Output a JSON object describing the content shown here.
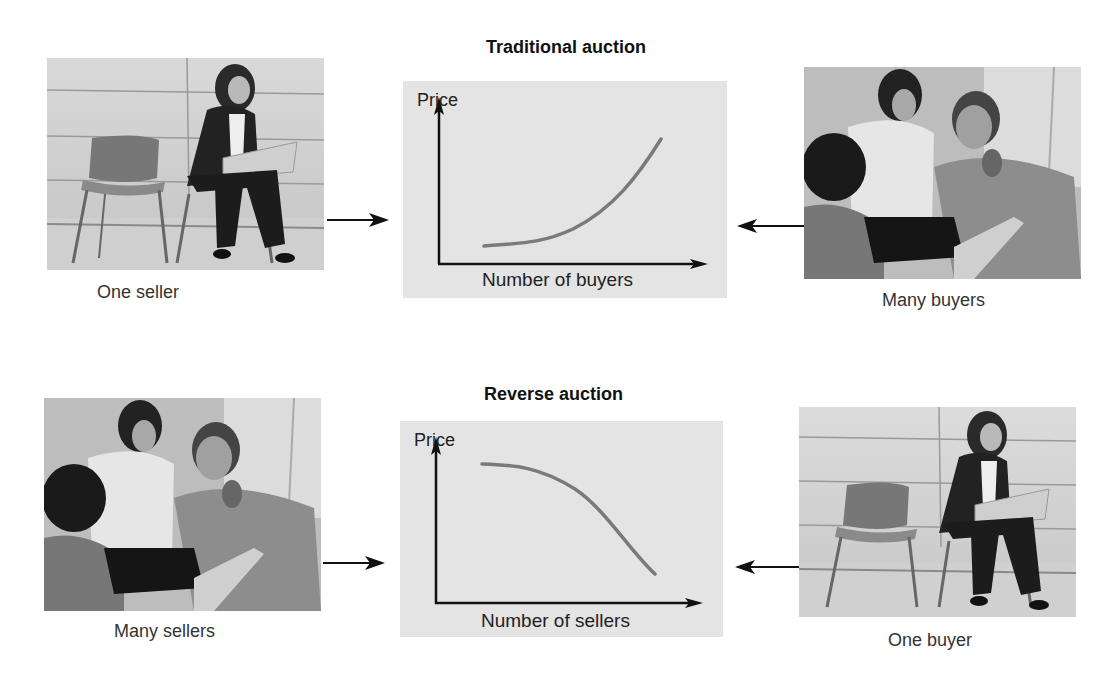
{
  "traditional": {
    "title": "Traditional auction",
    "left_caption": "One seller",
    "right_caption": "Many buyers",
    "y_axis_label": "Price",
    "x_axis_label": "Number of buyers",
    "curve_color": "#7a7a7a"
  },
  "reverse": {
    "title": "Reverse auction",
    "left_caption": "Many sellers",
    "right_caption": "One buyer",
    "y_axis_label": "Price",
    "x_axis_label": "Number of sellers",
    "curve_color": "#7a7a7a"
  },
  "colors": {
    "panel_bg": "#e4e4e4",
    "axis": "#111111",
    "text": "#222222"
  },
  "icons": {
    "arrow_right": "arrow-right-icon",
    "arrow_left": "arrow-left-icon"
  }
}
